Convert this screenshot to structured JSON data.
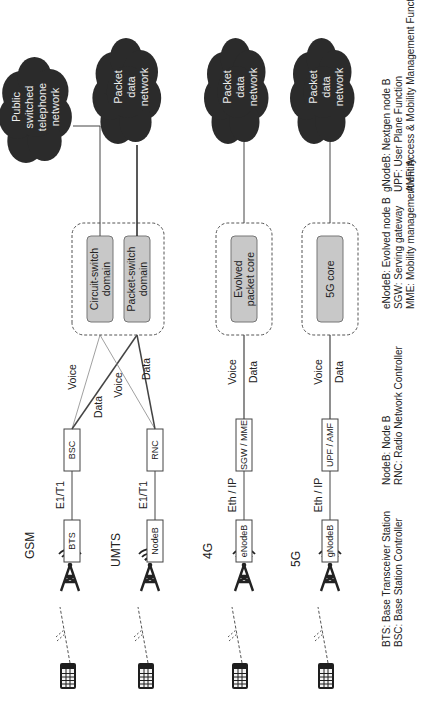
{
  "generations": [
    {
      "label": "GSM",
      "station": "BTS",
      "link": "E1/T1",
      "controller": "BSC"
    },
    {
      "label": "UMTS",
      "station": "NodeB",
      "link": "E1/T1",
      "controller": "RNC"
    },
    {
      "label": "4G",
      "station": "eNodeB",
      "link": "Eth / IP",
      "controller": "SGW / MME",
      "voice_label": "Voice",
      "data_label": "Data",
      "core": [
        "Evolved",
        "packet core"
      ],
      "cloud": [
        "Packet",
        "data",
        "network"
      ]
    },
    {
      "label": "5G",
      "station": "gNodeB",
      "link": "Eth / IP",
      "controller": "UPF / AMF",
      "voice_label": "Voice",
      "data_label": "Data",
      "core": [
        "5G core"
      ],
      "cloud": [
        "Packet",
        "data",
        "network"
      ]
    }
  ],
  "legacy_core": {
    "circuit_switch": [
      "Circuit-switch",
      "domain"
    ],
    "packet_switch": [
      "Packet-switch",
      "domain"
    ],
    "cross_labels": {
      "voice_top": "Voice",
      "data_mid": "Data",
      "voice_mid": "Voice",
      "data_bottom": "Data"
    },
    "pstn_cloud": [
      "Public",
      "switched",
      "telephone",
      "network"
    ],
    "pdn_cloud": [
      "Packet",
      "data",
      "network"
    ]
  },
  "legend": {
    "col1": [
      "BTS: Base Transceiver Station",
      "BSC: Base Station Controller"
    ],
    "col2": [
      "NodeB: Node B",
      "RNC: Radio Network Controller"
    ],
    "col3": [
      "eNodeB: Evolved node B",
      "SGW: Serving gateway",
      "MME: Mobility management entity"
    ],
    "col4": [
      "gNodeB: Nextgen node B",
      "UPF: User Plane Function",
      "AMF: Access & Mobility Management Function"
    ]
  },
  "colors": {
    "cloud_fill": "#2b2b2b",
    "core_fill": "#c8c8c8",
    "line": "#444444",
    "dashed_border": "#555555"
  }
}
